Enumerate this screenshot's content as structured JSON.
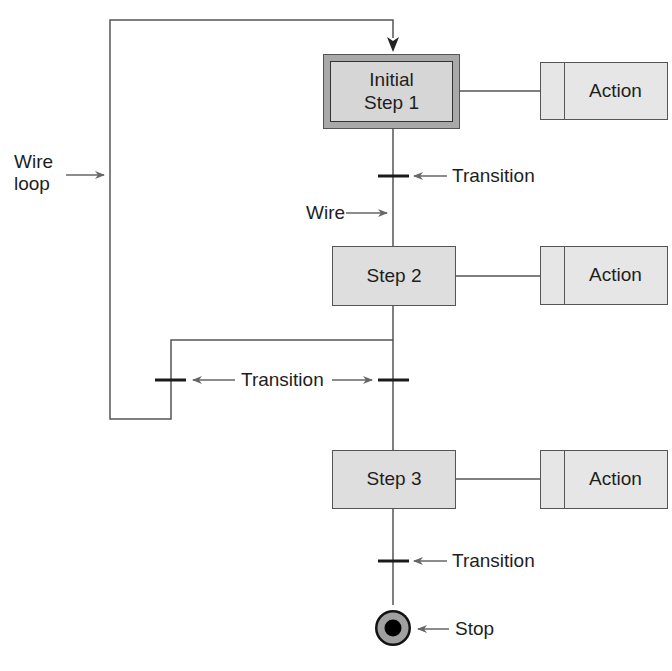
{
  "diagram": {
    "type": "sequential function chart",
    "colors": {
      "line": "#555555",
      "arrow": "#666666",
      "initial_step_outer": "#a9a9a9",
      "initial_step_inner": "#d6d6d6",
      "step_fill": "#dedede",
      "action_fill": "#e6e6e6",
      "transition_bar": "#1a1a1a",
      "stop_ring": "#a0a0a0",
      "stop_core": "#000000"
    },
    "steps": [
      {
        "id": "initial-step-1",
        "line1": "Initial",
        "line2": "Step 1",
        "action": "Action"
      },
      {
        "id": "step-2",
        "label": "Step 2",
        "action": "Action"
      },
      {
        "id": "step-3",
        "label": "Step 3",
        "action": "Action"
      }
    ],
    "annotations": {
      "wire_loop_line1": "Wire",
      "wire_loop_line2": "loop",
      "wire": "Wire",
      "transition_1": "Transition",
      "transition_branch": "Transition",
      "transition_3": "Transition",
      "stop": "Stop"
    }
  }
}
